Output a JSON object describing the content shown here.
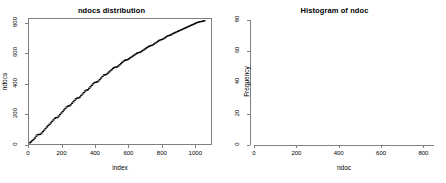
{
  "figure": {
    "background_color": "#ffffff",
    "foreground_color": "#000000",
    "axis_color": "#808080",
    "panel_count": 2
  },
  "chart_data": [
    {
      "type": "scatter",
      "id": "ndocs-distribution",
      "title": "ndocs distribution",
      "xlabel": "index",
      "ylabel": "ndocs",
      "xlim": [
        0,
        1100
      ],
      "ylim": [
        0,
        830
      ],
      "xticks": [
        0,
        200,
        400,
        600,
        800,
        1000
      ],
      "yticks": [
        0,
        200,
        400,
        600,
        800
      ],
      "xtick_labels": [
        "0",
        "200",
        "400",
        "600",
        "800",
        "1000"
      ],
      "ytick_labels": [
        "0",
        "200",
        "400",
        "600",
        "800"
      ],
      "grid": false,
      "legend": "none",
      "description": "Sorted index plot of ndocs values forming a near-linear staircase",
      "point_color": "#000000",
      "point_size": 1.2,
      "x": [
        5,
        12,
        20,
        28,
        36,
        44,
        52,
        60,
        68,
        76,
        84,
        92,
        100,
        108,
        116,
        124,
        132,
        140,
        148,
        156,
        164,
        172,
        180,
        188,
        196,
        204,
        212,
        220,
        228,
        236,
        244,
        252,
        260,
        268,
        276,
        284,
        292,
        300,
        308,
        316,
        324,
        332,
        340,
        348,
        356,
        364,
        372,
        380,
        388,
        396,
        404,
        412,
        420,
        428,
        436,
        444,
        452,
        460,
        468,
        476,
        484,
        492,
        500,
        508,
        516,
        524,
        532,
        540,
        548,
        556,
        564,
        572,
        580,
        588,
        596,
        604,
        612,
        620,
        628,
        636,
        644,
        652,
        660,
        668,
        676,
        684,
        692,
        700,
        708,
        716,
        724,
        732,
        740,
        748,
        756,
        764,
        772,
        780,
        788,
        796,
        804,
        812,
        820,
        828,
        836,
        844,
        852,
        860,
        868,
        876,
        884,
        892,
        900,
        908,
        916,
        924,
        932,
        940,
        948,
        956,
        964,
        972,
        980,
        988,
        996,
        1004,
        1012,
        1020,
        1028,
        1036,
        1044,
        1052,
        1060
      ],
      "y": [
        8,
        14,
        22,
        30,
        40,
        52,
        62,
        63,
        64,
        72,
        82,
        92,
        103,
        113,
        122,
        130,
        140,
        150,
        160,
        170,
        175,
        176,
        185,
        196,
        206,
        216,
        226,
        236,
        246,
        252,
        253,
        260,
        270,
        280,
        290,
        300,
        305,
        306,
        312,
        322,
        332,
        342,
        352,
        358,
        360,
        370,
        380,
        390,
        400,
        408,
        410,
        412,
        418,
        428,
        438,
        448,
        458,
        460,
        462,
        470,
        478,
        486,
        494,
        502,
        508,
        510,
        512,
        518,
        526,
        534,
        542,
        550,
        556,
        558,
        560,
        566,
        572,
        578,
        584,
        590,
        596,
        602,
        606,
        608,
        612,
        618,
        624,
        630,
        636,
        642,
        648,
        652,
        654,
        658,
        664,
        670,
        676,
        682,
        688,
        692,
        694,
        698,
        704,
        710,
        716,
        720,
        722,
        726,
        732,
        736,
        740,
        744,
        748,
        752,
        756,
        760,
        764,
        768,
        772,
        776,
        780,
        784,
        788,
        792,
        796,
        800,
        804,
        808,
        810,
        812,
        814,
        816,
        818
      ]
    },
    {
      "type": "bar",
      "id": "histogram-of-ndoc",
      "subtype": "histogram",
      "title": "Histogram of ndoc",
      "xlabel": "ndoc",
      "ylabel": "Frequency",
      "xlim": [
        0,
        850
      ],
      "ylim": [
        0,
        81
      ],
      "xticks": [
        0,
        200,
        400,
        600,
        800
      ],
      "yticks": [
        0,
        20,
        40,
        60,
        80
      ],
      "xtick_labels": [
        "0",
        "200",
        "400",
        "600",
        "800"
      ],
      "ytick_labels": [
        "0",
        "20",
        "40",
        "60",
        "80"
      ],
      "grid": false,
      "legend": "none",
      "bin_width": 50,
      "bar_fill": "#ffffff",
      "bar_stroke": "#595959",
      "bin_edges": [
        0,
        50,
        100,
        150,
        200,
        250,
        300,
        350,
        400,
        450,
        500,
        550,
        600,
        650,
        700,
        750,
        800,
        850
      ],
      "categories": [
        "0-50",
        "50-100",
        "100-150",
        "150-200",
        "200-250",
        "250-300",
        "300-350",
        "350-400",
        "400-450",
        "450-500",
        "500-550",
        "550-600",
        "600-650",
        "650-700",
        "700-750",
        "750-800",
        "800-850"
      ],
      "values": [
        27,
        69,
        74,
        74,
        79,
        72,
        76,
        73,
        76,
        65,
        63,
        64,
        63,
        51,
        54,
        51,
        35
      ]
    }
  ]
}
